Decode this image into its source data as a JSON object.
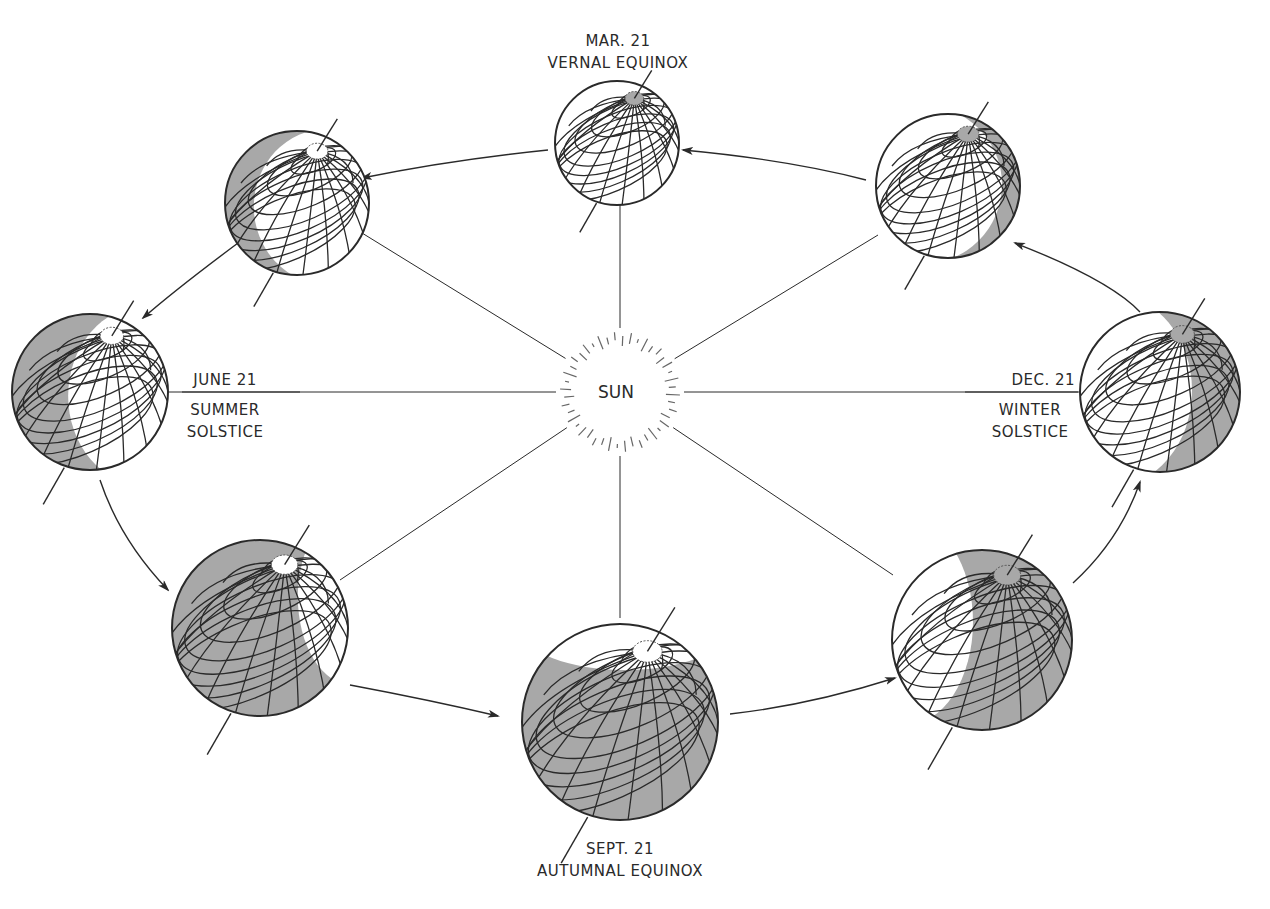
{
  "sun": {
    "label": "SUN",
    "center": [
      620,
      392
    ],
    "ray_inner": 46,
    "ray_outer": 60,
    "ray_count": 44
  },
  "labels": {
    "vernal": {
      "date": "MAR. 21",
      "name": "VERNAL EQUINOX"
    },
    "summer": {
      "date": "JUNE 21",
      "name_line1": "SUMMER",
      "name_line2": "SOLSTICE"
    },
    "autumnal": {
      "date": "SEPT. 21",
      "name": "AUTUMNAL EQUINOX"
    },
    "winter": {
      "date": "DEC. 21",
      "name_line1": "WINTER",
      "name_line2": "SOLSTICE"
    }
  },
  "colors": {
    "line": "#2a2a2a",
    "shade": "#a8a8a8",
    "globe_fill": "#ffffff",
    "background": "#ffffff"
  },
  "globes": [
    {
      "id": "vernal-equinox",
      "cx": 617,
      "cy": 143,
      "r": 62,
      "shade": "top-cap",
      "pole_shaded": true
    },
    {
      "id": "late-spring",
      "cx": 297,
      "cy": 203,
      "r": 72,
      "shade": "left-crescent",
      "pole_shaded": false
    },
    {
      "id": "summer-solstice",
      "cx": 90,
      "cy": 392,
      "r": 78,
      "shade": "left-half",
      "pole_shaded": false
    },
    {
      "id": "late-summer",
      "cx": 260,
      "cy": 628,
      "r": 88,
      "shade": "mostly",
      "pole_shaded": false
    },
    {
      "id": "autumnal-equinox",
      "cx": 620,
      "cy": 722,
      "r": 98,
      "shade": "bottom-large",
      "pole_shaded": false
    },
    {
      "id": "late-autumn",
      "cx": 982,
      "cy": 640,
      "r": 90,
      "shade": "right-large",
      "pole_shaded": true
    },
    {
      "id": "winter-solstice",
      "cx": 1160,
      "cy": 392,
      "r": 80,
      "shade": "right-half",
      "pole_shaded": true
    },
    {
      "id": "late-winter",
      "cx": 948,
      "cy": 186,
      "r": 72,
      "shade": "right-crescent",
      "pole_shaded": true
    }
  ],
  "orbit_arrows": [
    {
      "from": "vernal-equinox",
      "path": "M 548 150 Q 450 160 362 178",
      "head": [
        362,
        178
      ]
    },
    {
      "from": "late-spring",
      "path": "M 238 243 Q 175 290 143 318",
      "head": [
        143,
        318
      ]
    },
    {
      "from": "summer-solstice",
      "path": "M 100 480 Q 120 540 168 590",
      "head": [
        168,
        590
      ]
    },
    {
      "from": "late-summer",
      "path": "M 350 685 Q 430 700 498 716",
      "head": [
        498,
        716
      ]
    },
    {
      "from": "autumnal-equinox",
      "path": "M 730 714 Q 810 705 895 678",
      "head": [
        895,
        678
      ]
    },
    {
      "from": "late-autumn",
      "path": "M 1073 583 Q 1120 540 1140 482",
      "head": [
        1140,
        482
      ]
    },
    {
      "from": "winter-solstice",
      "path": "M 1140 312 Q 1110 280 1015 243",
      "head": [
        1015,
        243
      ]
    },
    {
      "from": "late-winter",
      "path": "M 866 180 Q 790 160 683 150",
      "head": [
        683,
        150
      ]
    }
  ],
  "sun_rays": [
    {
      "to": [
        620,
        205
      ]
    },
    {
      "to": [
        362,
        233
      ]
    },
    {
      "to": [
        168,
        392
      ]
    },
    {
      "to": [
        340,
        580
      ]
    },
    {
      "to": [
        620,
        618
      ]
    },
    {
      "to": [
        893,
        575
      ]
    },
    {
      "to": [
        1078,
        392
      ]
    },
    {
      "to": [
        878,
        235
      ]
    }
  ]
}
